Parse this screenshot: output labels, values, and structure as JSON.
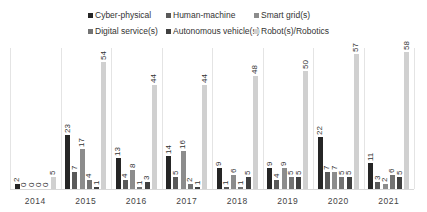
{
  "chart_data": {
    "type": "bar",
    "title": "",
    "xlabel": "",
    "ylabel": "",
    "ylim": [
      0,
      60
    ],
    "grid": false,
    "legend_position": "top",
    "categories": [
      "2014",
      "2015",
      "2016",
      "2017",
      "2018",
      "2019",
      "2020",
      "2021"
    ],
    "series": [
      {
        "name": "Cyber-physical",
        "color": "#262626",
        "values": [
          2,
          23,
          13,
          14,
          9,
          9,
          22,
          11
        ]
      },
      {
        "name": "Human-machine",
        "color": "#595959",
        "values": [
          0,
          7,
          4,
          5,
          1,
          4,
          7,
          3
        ]
      },
      {
        "name": "Smart grid(s)",
        "color": "#8c8c8c",
        "values": [
          0,
          17,
          8,
          16,
          6,
          9,
          7,
          2
        ]
      },
      {
        "name": "Digital service(s)",
        "color": "#737373",
        "values": [
          0,
          4,
          1,
          2,
          1,
          5,
          5,
          6
        ]
      },
      {
        "name": "Autonomous vehicle(s)",
        "color": "#404040",
        "values": [
          0,
          1,
          3,
          1,
          5,
          5,
          5,
          5
        ]
      },
      {
        "name": "Robot(s)/Robotics",
        "color": "#d0d0d0",
        "values": [
          5,
          54,
          44,
          44,
          48,
          50,
          57,
          58
        ]
      }
    ]
  },
  "legend": {
    "items": [
      {
        "label": "Cyber-physical",
        "color": "#262626"
      },
      {
        "label": "Human-machine",
        "color": "#595959"
      },
      {
        "label": "Smart grid(s)",
        "color": "#8c8c8c"
      },
      {
        "label": "Digital service(s)",
        "color": "#737373"
      },
      {
        "label": "Autonomous vehicle(s)",
        "color": "#404040"
      },
      {
        "label": "Robot(s)/Robotics",
        "color": "#d0d0d0"
      }
    ]
  }
}
